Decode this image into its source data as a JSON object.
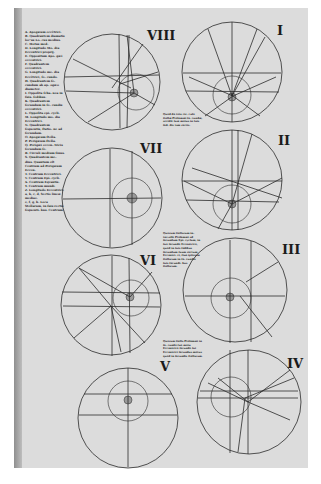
{
  "page": {
    "background": "#dcdcdc",
    "ink": "#1e1e1e"
  },
  "legend": {
    "entries": [
      "A. Apogæum eccêtrici.",
      "B. Quadrantem diamatis loc'us Lo- cus medius.",
      "C. Motus med.",
      "D. Longitudo Mo- dia Eccentrici proprij.",
      "E. Oppositum Apo- gæi eccentrici.",
      "F. Quadrantem eccentrici.",
      "G. Longitudo me- dia Eccêtrici, ſe- cundo.",
      "H. Quadrantem ſe- cundum ab ap- ogæo diameter.",
      "I. Oppoſita ſcha- nea in ſuis- ſedibus.",
      "K. Quadrantem ſecundum in ſe- cundis eccentrici.",
      "L. Oppoſita epi- cycli.",
      "M. Longitudo mo- dia Eccentrici.",
      "N. Quadrantem ſequentis, ſtatio- ne ad ſecundam.",
      "O. Apogæum ſtella.",
      "P. Perigæum ſtella.",
      "Q. Perigæi eccen- tricis ſecundum ſe.",
      "R. Circuli medium ſinus.",
      "S. Quadrantem me- dius. Quantum eſt Centrum ad Perigæum Eccen.",
      "T. Centrum Eccentrici.",
      "V. Centrum Epi- cycli.",
      "X. Centrum Eqvantis.",
      "Y. Centrum mundi.",
      "Z. Longitudo Eccentrici.",
      "a, b, c, d, Sectio lineæ mediae.",
      "e, f, g, h. Loca Stellarum, in ſuis rectis ſequenti- bus. Centrum."
    ]
  },
  "notes": [
    {
      "id": "note-1",
      "text": "Quod de tota cir- culo ſtellæ Ptolemæi ſe- cundæ, accidit ſuæ motus in ſuis ſed- dis tam rectis."
    },
    {
      "id": "note-2",
      "text": "Quorum ſtellarum in- tervallo Ptolemæi ad ſecundum Epi- cyclum, in ſuo ſecundo Eccentrico, quod in ſuis ſedibus ſecundum ſuum rectum Eccentri- ci, ſiue ipſorum ſtellarum in ſe- cundis ſuis ſecundi- bus ſtellarum."
    },
    {
      "id": "note-3",
      "text": "Quorum ſtella Ptolemæi in ſe- cundo ſuo motu Eccentrico ſecundo ſui Eccentrici ſecundus motus quod in ſecundis ſtellarum."
    }
  ],
  "figures": [
    {
      "id": "VIII",
      "numeral": "VIII",
      "labels": [
        "R",
        "S",
        "K",
        "G",
        "P",
        "H",
        "M",
        "N",
        "O",
        "D",
        "X",
        "Y",
        "Q",
        "F"
      ]
    },
    {
      "id": "I",
      "numeral": "I",
      "labels": [
        "A",
        "B",
        "L",
        "G",
        "H",
        "F",
        "E",
        "O",
        "D",
        "M",
        "R",
        "N",
        "T",
        "P",
        "S"
      ]
    },
    {
      "id": "VII",
      "numeral": "VII",
      "labels": [
        "B",
        "G",
        "A",
        "M",
        "C",
        "H",
        "E",
        "T",
        "B",
        "P",
        "F",
        "O",
        "Y"
      ]
    },
    {
      "id": "II",
      "numeral": "II",
      "labels": [
        "S",
        "R",
        "A",
        "H",
        "F",
        "G",
        "E",
        "M",
        "S",
        "N",
        "P",
        "Q",
        "E"
      ]
    },
    {
      "id": "VI",
      "numeral": "VI",
      "labels": [
        "E",
        "Z",
        "G",
        "F",
        "H",
        "C",
        "T",
        "I",
        "Q",
        "R",
        "S",
        "A",
        "D",
        "F",
        "Y"
      ]
    },
    {
      "id": "III",
      "numeral": "III",
      "labels": [
        "S",
        "D",
        "R",
        "P",
        "F",
        "D",
        "T",
        "A",
        "G",
        "E",
        "B",
        "Y",
        "H"
      ]
    },
    {
      "id": "V",
      "numeral": "V",
      "labels": [
        "F",
        "B",
        "M",
        "T",
        "N",
        "L",
        "C",
        "O",
        "P",
        "X"
      ]
    },
    {
      "id": "IV",
      "numeral": "IV",
      "labels": [
        "O",
        "T",
        "R",
        "A",
        "B",
        "G",
        "E",
        "H",
        "M",
        "C",
        "D",
        "Q",
        "L",
        "F"
      ]
    }
  ]
}
